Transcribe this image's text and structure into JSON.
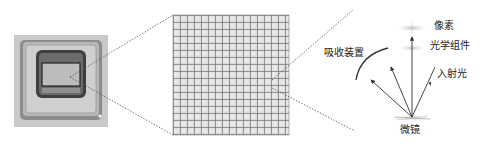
{
  "figure": {
    "panels": [
      {
        "id": "chip-photo",
        "description": "DMD chip package photograph"
      },
      {
        "id": "micromirror-array",
        "description": "magnified micromirror grid",
        "rows": 17,
        "cols": 17
      },
      {
        "id": "optical-path",
        "description": "reflection schematic"
      }
    ],
    "labels": {
      "pixel": "像素",
      "optics": "光学组件",
      "absorber": "吸收装置",
      "incident_light": "入射光",
      "micromirror": "微镜"
    },
    "colors": {
      "line": "#333333",
      "dotted": "#555555",
      "grid_bg": "#d8d8d8",
      "grid_line": "#5a5a5a",
      "chip_outer": "#8a8a8a",
      "chip_inner": "#b9b9b9"
    }
  }
}
